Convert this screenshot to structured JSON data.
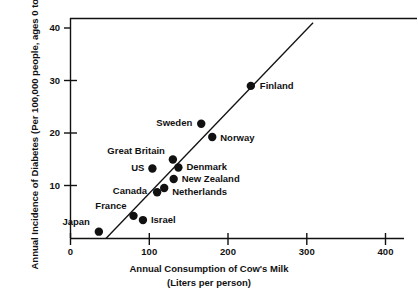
{
  "chart_data": {
    "type": "scatter",
    "title": "",
    "xlabel": "Annual Consumption of Cow's Milk (Liters per person)",
    "ylabel": "Annual Incidence of Diabetes (Per 100,000 people, ages 0 to 14)",
    "xlim": [
      0,
      400
    ],
    "ylim": [
      0,
      42
    ],
    "grid": false,
    "legend": "none",
    "xticks": [
      "0",
      "100",
      "200",
      "300",
      "400"
    ],
    "xtick_values": [
      0,
      100,
      200,
      300,
      400
    ],
    "yticks": [
      "10",
      "20",
      "30",
      "40"
    ],
    "ytick_values": [
      10,
      20,
      30,
      40
    ],
    "points": [
      {
        "label": "Japan",
        "x": 36,
        "y": 1.3
      },
      {
        "label": "France",
        "x": 80,
        "y": 4.3
      },
      {
        "label": "Israel",
        "x": 92,
        "y": 3.5
      },
      {
        "label": "Canada",
        "x": 110,
        "y": 8.8
      },
      {
        "label": "Netherlands",
        "x": 119,
        "y": 9.6
      },
      {
        "label": "US",
        "x": 104,
        "y": 13.3
      },
      {
        "label": "New Zealand",
        "x": 131,
        "y": 11.3
      },
      {
        "label": "Denmark",
        "x": 137,
        "y": 13.5
      },
      {
        "label": "Great Britain",
        "x": 130,
        "y": 15.0
      },
      {
        "label": "Norway",
        "x": 180,
        "y": 19.3
      },
      {
        "label": "Sweden",
        "x": 166,
        "y": 21.8
      },
      {
        "label": "Finland",
        "x": 229,
        "y": 29.0
      }
    ],
    "trendline": {
      "x0": 45,
      "y0": 0,
      "x1": 308,
      "y1": 41
    },
    "marker_color": "#111111",
    "line_color": "#111111",
    "axis_color": "#111111"
  },
  "axes": {
    "y_title_line1": "Annual Incidence of Diabetes",
    "y_title_line2": "(Per 100,000 people, ages 0 to 14)",
    "x_title_line1": "Annual Consumption of Cow's Milk",
    "x_title_line2": "(Liters per person)"
  },
  "ticks": {
    "x": [
      {
        "value": 0,
        "label": "0"
      },
      {
        "value": 100,
        "label": "100"
      },
      {
        "value": 200,
        "label": "200"
      },
      {
        "value": 300,
        "label": "300"
      },
      {
        "value": 400,
        "label": "400"
      }
    ],
    "y": [
      {
        "value": 10,
        "label": "10"
      },
      {
        "value": 20,
        "label": "20"
      },
      {
        "value": 30,
        "label": "30"
      },
      {
        "value": 40,
        "label": "40"
      }
    ]
  },
  "point_labels": {
    "japan": "Japan",
    "france": "France",
    "israel": "Israel",
    "canada": "Canada",
    "netherlands": "Netherlands",
    "us": "US",
    "new_zealand": "New Zealand",
    "denmark": "Denmark",
    "great_britain": "Great Britain",
    "norway": "Norway",
    "sweden": "Sweden",
    "finland": "Finland"
  }
}
